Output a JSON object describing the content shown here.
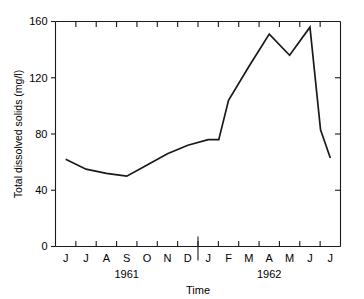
{
  "chart_data": {
    "type": "line",
    "title": "",
    "xlabel": "Time",
    "ylabel": "Total dissolved solids (mg/l)",
    "ylim": [
      0,
      160
    ],
    "ytick_labels": [
      "0",
      "40",
      "80",
      "120",
      "160"
    ],
    "ytick_values": [
      0,
      40,
      80,
      120,
      160
    ],
    "grid": false,
    "legend": "none",
    "categories": [
      "J",
      "J",
      "A",
      "S",
      "O",
      "N",
      "D",
      "J",
      "F",
      "M",
      "A",
      "M",
      "J",
      "J"
    ],
    "category_years": [
      "1961",
      "1961",
      "1961",
      "1961",
      "1961",
      "1961",
      "1961",
      "1962",
      "1962",
      "1962",
      "1962",
      "1962",
      "1962",
      "1962"
    ],
    "group_labels": [
      "1961",
      "1962"
    ],
    "values": [
      62,
      55,
      52,
      50,
      58,
      66,
      72,
      76,
      104,
      128,
      151,
      136,
      156,
      63
    ],
    "extra_vertices": [
      {
        "after_index": 7,
        "label": "late-D rise onset",
        "value": 76
      },
      {
        "after_index": 12,
        "label": "M-J shoulder",
        "value": 83
      }
    ],
    "annotations": []
  },
  "axes": {
    "y_axis_name": "y-axis",
    "x_axis_name": "x-axis",
    "top_spine": true,
    "right_spine": true,
    "tick_direction": "inward-outward"
  },
  "labels": {
    "y_axis_title": "Total dissolved solids (mg/l)",
    "x_axis_title": "Time",
    "ytick_0": "0",
    "ytick_40": "40",
    "ytick_80": "80",
    "ytick_120": "120",
    "ytick_160": "160",
    "year_1961": "1961",
    "year_1962": "1962",
    "months": [
      "J",
      "J",
      "A",
      "S",
      "O",
      "N",
      "D",
      "J",
      "F",
      "M",
      "A",
      "M",
      "J",
      "J"
    ]
  },
  "colors": {
    "line": "#1a1a1a",
    "axis": "#1a1a1a",
    "text": "#000000",
    "background": "#ffffff"
  }
}
